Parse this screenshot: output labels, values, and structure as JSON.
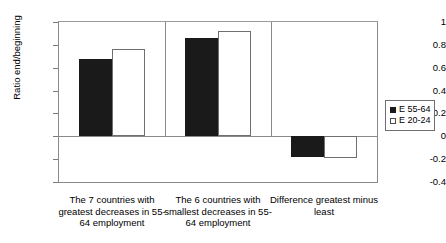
{
  "chart_data": {
    "type": "bar",
    "title": "",
    "xlabel": "",
    "ylabel": "Ratio end/beginning",
    "ylim": [
      -0.4,
      1
    ],
    "ytick_labels": [
      "1",
      "0.8",
      "0.6",
      "0.4",
      "0.2",
      "0",
      "-0.2",
      "-0.4"
    ],
    "ytick_values": [
      1,
      0.8,
      0.6,
      0.4,
      0.2,
      0,
      -0.2,
      -0.4
    ],
    "grid": false,
    "legend_position": "right",
    "categories": [
      "The 7 countries with greatest decreases in 55-64 employment",
      "The 6 countries with smallest decreases in 55-64 employment",
      "Difference greatest minus least"
    ],
    "series": [
      {
        "name": "E 55-64",
        "style": "filled",
        "color": "#1a1a1a",
        "values": [
          0.68,
          0.86,
          -0.18
        ]
      },
      {
        "name": "E 20-24",
        "style": "open",
        "color": "#ffffff",
        "values": [
          0.76,
          0.92,
          -0.19
        ]
      }
    ]
  },
  "axis": {
    "y_title": "Ratio end/beginning"
  },
  "legend": {
    "items": [
      {
        "label": "E 55-64",
        "style": "filled"
      },
      {
        "label": "E 20-24",
        "style": "open"
      }
    ]
  }
}
